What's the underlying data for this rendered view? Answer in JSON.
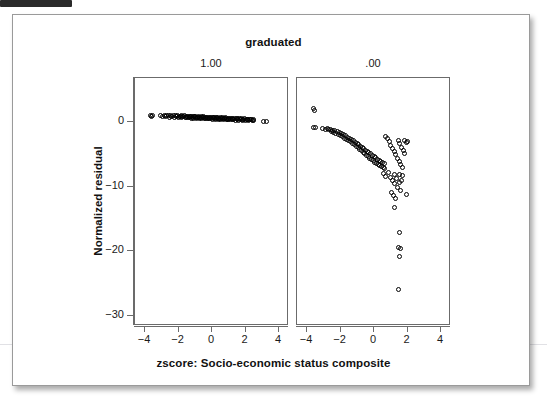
{
  "figure": {
    "title": "graduated",
    "x_axis_title": "zscore: Socio-economic status composite",
    "y_axis_title": "Normalized residual",
    "panel_labels": [
      "1.00",
      ".00"
    ],
    "point_color": "#000000",
    "frame_color": "#6b6b6b",
    "background": "#ffffff"
  },
  "chart_data": {
    "type": "scatter",
    "title": "graduated",
    "subtitle": "",
    "xlabel": "zscore: Socio-economic status composite",
    "ylabel": "Normalized residual",
    "grid": false,
    "legend_position": "none",
    "marker": "open-circle",
    "facet_variable": "graduated",
    "panels": [
      {
        "label": "1.00",
        "xlim": [
          -4.6,
          4.6
        ],
        "ylim": [
          -31.6,
          6.8
        ],
        "xticks": [
          -4,
          -2,
          0,
          2,
          4
        ],
        "yticks": [
          0,
          -10,
          -20,
          -30
        ],
        "n_points": 460,
        "description": "Tight near-horizontal band of residuals just above and at zero, running from x=-3.7 to x=3.3, drifting slightly downward toward the right.",
        "points": [
          [
            -3.7,
            0.95
          ],
          [
            -3.62,
            0.8
          ],
          [
            -3.58,
            1.05
          ],
          [
            -3.1,
            1.0
          ],
          [
            -2.95,
            0.9
          ],
          [
            -2.86,
            1.05
          ],
          [
            -2.78,
            0.85
          ],
          [
            -2.7,
            1.0
          ],
          [
            -2.62,
            0.95
          ],
          [
            -2.55,
            0.75
          ],
          [
            -2.48,
            1.0
          ],
          [
            -2.4,
            0.88
          ],
          [
            -2.33,
            0.95
          ],
          [
            -2.26,
            0.7
          ],
          [
            -2.2,
            0.92
          ],
          [
            -2.14,
            0.8
          ],
          [
            -2.08,
            0.98
          ],
          [
            -2.02,
            0.72
          ],
          [
            -1.96,
            0.9
          ],
          [
            -1.9,
            0.82
          ],
          [
            -1.85,
            0.95
          ],
          [
            -1.8,
            0.68
          ],
          [
            -1.75,
            0.88
          ],
          [
            -1.7,
            0.78
          ],
          [
            -1.65,
            0.92
          ],
          [
            -1.6,
            0.65
          ],
          [
            -1.55,
            0.85
          ],
          [
            -1.5,
            0.75
          ],
          [
            -1.45,
            0.9
          ],
          [
            -1.4,
            0.62
          ],
          [
            -1.36,
            0.82
          ],
          [
            -1.32,
            0.72
          ],
          [
            -1.28,
            0.88
          ],
          [
            -1.24,
            0.6
          ],
          [
            -1.2,
            0.8
          ],
          [
            -1.16,
            0.7
          ],
          [
            -1.12,
            0.86
          ],
          [
            -1.08,
            0.58
          ],
          [
            -1.04,
            0.78
          ],
          [
            -1.0,
            0.68
          ],
          [
            -0.96,
            0.84
          ],
          [
            -0.92,
            0.56
          ],
          [
            -0.88,
            0.76
          ],
          [
            -0.84,
            0.66
          ],
          [
            -0.8,
            0.82
          ],
          [
            -0.76,
            0.54
          ],
          [
            -0.72,
            0.74
          ],
          [
            -0.68,
            0.64
          ],
          [
            -0.64,
            0.8
          ],
          [
            -0.6,
            0.52
          ],
          [
            -0.56,
            0.72
          ],
          [
            -0.52,
            0.62
          ],
          [
            -0.48,
            0.78
          ],
          [
            -0.44,
            0.5
          ],
          [
            -0.4,
            0.7
          ],
          [
            -0.36,
            0.6
          ],
          [
            -0.32,
            0.76
          ],
          [
            -0.28,
            0.48
          ],
          [
            -0.24,
            0.68
          ],
          [
            -0.2,
            0.58
          ],
          [
            -0.16,
            0.74
          ],
          [
            -0.12,
            0.46
          ],
          [
            -0.08,
            0.66
          ],
          [
            -0.04,
            0.56
          ],
          [
            0.0,
            0.72
          ],
          [
            0.04,
            0.44
          ],
          [
            0.08,
            0.64
          ],
          [
            0.12,
            0.54
          ],
          [
            0.16,
            0.7
          ],
          [
            0.2,
            0.42
          ],
          [
            0.24,
            0.62
          ],
          [
            0.28,
            0.52
          ],
          [
            0.32,
            0.68
          ],
          [
            0.36,
            0.4
          ],
          [
            0.4,
            0.6
          ],
          [
            0.44,
            0.5
          ],
          [
            0.48,
            0.66
          ],
          [
            0.52,
            0.38
          ],
          [
            0.56,
            0.58
          ],
          [
            0.6,
            0.48
          ],
          [
            0.64,
            0.64
          ],
          [
            0.68,
            0.36
          ],
          [
            0.72,
            0.56
          ],
          [
            0.76,
            0.46
          ],
          [
            0.8,
            0.62
          ],
          [
            0.84,
            0.34
          ],
          [
            0.88,
            0.54
          ],
          [
            0.92,
            0.44
          ],
          [
            0.96,
            0.6
          ],
          [
            1.0,
            0.32
          ],
          [
            1.05,
            0.52
          ],
          [
            1.1,
            0.42
          ],
          [
            1.15,
            0.58
          ],
          [
            1.2,
            0.3
          ],
          [
            1.25,
            0.5
          ],
          [
            1.3,
            0.4
          ],
          [
            1.35,
            0.55
          ],
          [
            1.4,
            0.28
          ],
          [
            1.45,
            0.48
          ],
          [
            1.5,
            0.38
          ],
          [
            1.55,
            0.52
          ],
          [
            1.6,
            0.26
          ],
          [
            1.65,
            0.46
          ],
          [
            1.7,
            0.36
          ],
          [
            1.75,
            0.5
          ],
          [
            1.8,
            0.24
          ],
          [
            1.85,
            0.44
          ],
          [
            1.9,
            0.34
          ],
          [
            1.95,
            0.48
          ],
          [
            2.0,
            0.22
          ],
          [
            2.05,
            0.42
          ],
          [
            2.1,
            0.32
          ],
          [
            2.15,
            0.44
          ],
          [
            2.2,
            0.2
          ],
          [
            2.25,
            0.38
          ],
          [
            2.3,
            0.3
          ],
          [
            2.35,
            0.4
          ],
          [
            2.4,
            0.18
          ],
          [
            2.45,
            0.32
          ],
          [
            2.5,
            0.25
          ],
          [
            3.05,
            0.1
          ],
          [
            3.25,
            0.1
          ]
        ]
      },
      {
        "label": ".00",
        "xlim": [
          -4.6,
          4.6
        ],
        "ylim": [
          -31.6,
          6.8
        ],
        "xticks": [
          -4,
          -2,
          0,
          2,
          4
        ],
        "yticks": [
          0,
          -10,
          -20,
          -30
        ],
        "n_points": 520,
        "description": "Dense wedge-shaped cloud fanning out downward from the upper left; bulk between 0 and -7, with a long lower tail of outliers near x=1 to 2 reaching about -26.",
        "points": [
          [
            -3.62,
            2.1
          ],
          [
            -3.58,
            1.8
          ],
          [
            -3.6,
            -0.85
          ],
          [
            -3.5,
            -0.9
          ],
          [
            -3.05,
            -0.95
          ],
          [
            -2.9,
            -1.1
          ],
          [
            -2.8,
            -1.0
          ],
          [
            -2.72,
            -1.25
          ],
          [
            -2.62,
            -1.15
          ],
          [
            -2.55,
            -1.45
          ],
          [
            -2.48,
            -1.3
          ],
          [
            -2.4,
            -1.6
          ],
          [
            -2.34,
            -1.4
          ],
          [
            -2.28,
            -1.75
          ],
          [
            -2.2,
            -1.55
          ],
          [
            -2.14,
            -1.95
          ],
          [
            -2.08,
            -1.7
          ],
          [
            -2.02,
            -2.1
          ],
          [
            -1.96,
            -1.85
          ],
          [
            -1.9,
            -2.3
          ],
          [
            -1.84,
            -2.0
          ],
          [
            -1.78,
            -2.5
          ],
          [
            -1.72,
            -2.15
          ],
          [
            -1.66,
            -2.7
          ],
          [
            -1.6,
            -2.35
          ],
          [
            -1.54,
            -2.9
          ],
          [
            -1.48,
            -2.55
          ],
          [
            -1.42,
            -3.1
          ],
          [
            -1.36,
            -2.75
          ],
          [
            -1.3,
            -3.35
          ],
          [
            -1.24,
            -2.95
          ],
          [
            -1.18,
            -3.55
          ],
          [
            -1.12,
            -3.15
          ],
          [
            -1.06,
            -3.8
          ],
          [
            -1.0,
            -3.35
          ],
          [
            -0.95,
            -4.0
          ],
          [
            -0.9,
            -3.55
          ],
          [
            -0.85,
            -4.25
          ],
          [
            -0.8,
            -3.75
          ],
          [
            -0.75,
            -4.45
          ],
          [
            -0.7,
            -3.95
          ],
          [
            -0.65,
            -4.7
          ],
          [
            -0.6,
            -4.15
          ],
          [
            -0.55,
            -4.9
          ],
          [
            -0.5,
            -4.35
          ],
          [
            -0.45,
            -5.15
          ],
          [
            -0.4,
            -4.55
          ],
          [
            -0.35,
            -5.35
          ],
          [
            -0.3,
            -4.75
          ],
          [
            -0.25,
            -5.6
          ],
          [
            -0.2,
            -4.95
          ],
          [
            -0.15,
            -5.8
          ],
          [
            -0.1,
            -5.15
          ],
          [
            -0.05,
            -6.05
          ],
          [
            0.0,
            -5.35
          ],
          [
            0.05,
            -6.25
          ],
          [
            0.1,
            -5.55
          ],
          [
            0.15,
            -6.45
          ],
          [
            0.2,
            -5.75
          ],
          [
            0.25,
            -6.6
          ],
          [
            0.3,
            -5.95
          ],
          [
            0.35,
            -6.75
          ],
          [
            0.4,
            -6.1
          ],
          [
            0.45,
            -6.9
          ],
          [
            0.5,
            -6.25
          ],
          [
            0.55,
            -7.05
          ],
          [
            0.6,
            -6.4
          ],
          [
            0.65,
            -7.2
          ],
          [
            0.7,
            -2.2
          ],
          [
            0.8,
            -2.6
          ],
          [
            0.9,
            -3.1
          ],
          [
            1.0,
            -3.6
          ],
          [
            1.1,
            -4.1
          ],
          [
            1.2,
            -4.6
          ],
          [
            1.3,
            -5.1
          ],
          [
            1.4,
            -5.6
          ],
          [
            1.45,
            -2.9
          ],
          [
            1.5,
            -6.1
          ],
          [
            1.55,
            -3.4
          ],
          [
            1.6,
            -6.6
          ],
          [
            1.65,
            -3.9
          ],
          [
            1.7,
            -7.1
          ],
          [
            1.75,
            -4.4
          ],
          [
            1.8,
            -2.95
          ],
          [
            1.85,
            -4.9
          ],
          [
            1.95,
            -3.2
          ],
          [
            2.0,
            -3.1
          ],
          [
            0.55,
            -8.0
          ],
          [
            0.7,
            -8.4
          ],
          [
            0.85,
            -7.9
          ],
          [
            1.0,
            -8.6
          ],
          [
            1.1,
            -9.1
          ],
          [
            1.2,
            -8.2
          ],
          [
            1.25,
            -9.6
          ],
          [
            1.35,
            -8.8
          ],
          [
            1.4,
            -10.2
          ],
          [
            1.5,
            -9.4
          ],
          [
            1.55,
            -8.1
          ],
          [
            1.6,
            -10.6
          ],
          [
            1.65,
            -9.0
          ],
          [
            1.7,
            -8.3
          ],
          [
            1.05,
            -10.9
          ],
          [
            1.15,
            -11.4
          ],
          [
            1.3,
            -11.8
          ],
          [
            1.95,
            -11.2
          ],
          [
            1.2,
            -13.3
          ],
          [
            1.5,
            -17.1
          ],
          [
            1.45,
            -19.4
          ],
          [
            1.58,
            -19.6
          ],
          [
            1.52,
            -20.8
          ],
          [
            1.48,
            -25.9
          ]
        ]
      }
    ]
  }
}
